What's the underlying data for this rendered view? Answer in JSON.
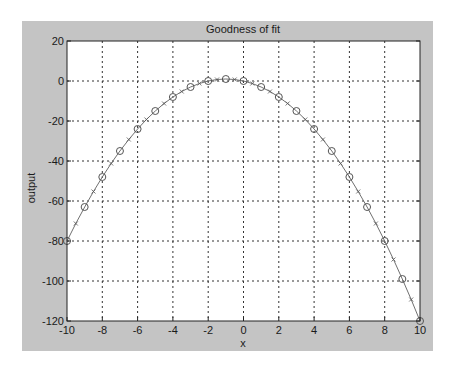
{
  "chart_data": {
    "type": "line",
    "title": "Goodness of fit",
    "xlabel": "x",
    "ylabel": "output",
    "xlim": [
      -10,
      10
    ],
    "ylim": [
      -120,
      20
    ],
    "xticks": [
      -10,
      -8,
      -6,
      -4,
      -2,
      0,
      2,
      4,
      6,
      8,
      10
    ],
    "yticks": [
      20,
      0,
      -20,
      -40,
      -60,
      -80,
      -100,
      -120
    ],
    "grid": true,
    "legend": null,
    "series": [
      {
        "name": "data (circles)",
        "marker": "o",
        "x": [
          -10,
          -9,
          -8,
          -7,
          -6,
          -5,
          -4,
          -3,
          -2,
          -1,
          0,
          1,
          2,
          3,
          4,
          5,
          6,
          7,
          8,
          9,
          10
        ],
        "values": [
          -80,
          -63,
          -48,
          -35,
          -24,
          -15,
          -8,
          -3,
          0,
          1,
          0,
          -3,
          -8,
          -15,
          -24,
          -35,
          -48,
          -63,
          -80,
          -99,
          -120
        ]
      },
      {
        "name": "fit (line with x markers)",
        "marker": "x",
        "x": [
          -9.5,
          -8.5,
          -7.5,
          -6.5,
          -5.5,
          -4.5,
          -3.5,
          -2.5,
          -1.5,
          -0.5,
          0.5,
          1.5,
          2.5,
          3.5,
          4.5,
          5.5,
          6.5,
          7.5,
          8.5,
          9.5
        ],
        "values": [
          -71.25,
          -55.25,
          -41.25,
          -29.25,
          -19.25,
          -11.25,
          -5.25,
          -1.25,
          0.75,
          0.75,
          -1.25,
          -5.25,
          -11.25,
          -19.25,
          -29.25,
          -41.25,
          -55.25,
          -71.25,
          -89.25,
          -109.25
        ]
      }
    ]
  },
  "colors": {
    "figure_bg": "#c4c4c4",
    "axes_bg": "#ffffff",
    "line": "#707070",
    "grid": "#333333"
  }
}
